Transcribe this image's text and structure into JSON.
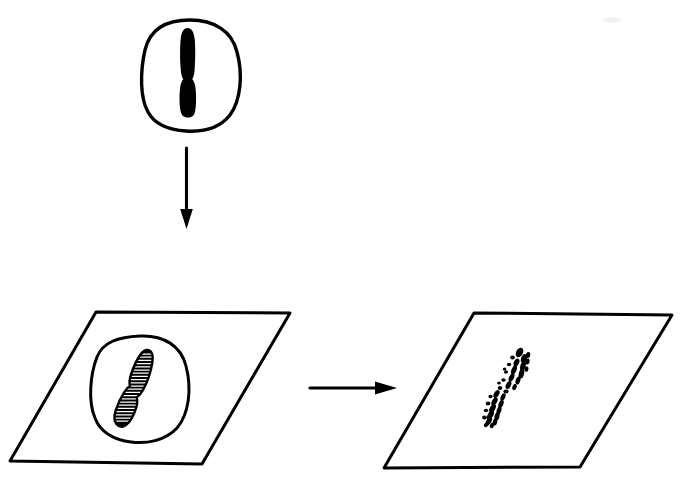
{
  "figure": {
    "title": "Chromosome preparation and in situ hybridization workflow",
    "background_color": "#ffffff",
    "ink_color": "#000000",
    "width": 690,
    "height": 486,
    "style": "black-and-white line drawing, no text labels"
  },
  "panels": [
    {
      "id": "panel-top-cell",
      "name": "intact-cell-with-chromosome",
      "description": "Rounded irregular cell outline containing a single solid black chromosome oriented vertically with a centromeric constriction below centre",
      "bounds": {
        "x": 141,
        "y": 20,
        "width": 99,
        "height": 112
      },
      "cell_outline": {
        "stroke_width": 3.2,
        "center": {
          "x": 190,
          "y": 76
        },
        "radius_x": 48,
        "radius_y": 55
      },
      "chromosome": {
        "type": "solid",
        "fill": "#000000",
        "top": {
          "x": 187,
          "y": 29
        },
        "bottom": {
          "x": 186,
          "y": 116
        },
        "max_width": 13,
        "centromere_y": 80
      }
    },
    {
      "id": "panel-bottom-left-slide",
      "name": "slide-with-banded-chromosome",
      "description": "Parallelogram representing a microscope slide; a circular cell outline sits on it containing one tilted chromosome drawn with fine horizontal banding (hatching)",
      "parallelogram": {
        "stroke_width": 3.0,
        "points": [
          {
            "x": 96,
            "y": 312
          },
          {
            "x": 290,
            "y": 313
          },
          {
            "x": 202,
            "y": 464
          },
          {
            "x": 10,
            "y": 461
          }
        ]
      },
      "cell_outline": {
        "stroke_width": 3.0,
        "center": {
          "x": 139,
          "y": 389
        },
        "radius_x": 47,
        "radius_y": 53
      },
      "chromosome": {
        "type": "banded",
        "fill": "#000000",
        "band_count": 22,
        "tilt_degrees": 22,
        "top": {
          "x": 148,
          "y": 351
        },
        "bottom": {
          "x": 113,
          "y": 424
        },
        "max_width": 15,
        "centromere_point": {
          "x": 128,
          "y": 388
        }
      }
    },
    {
      "id": "panel-bottom-right-slide",
      "name": "slide-with-hybridization-signal",
      "description": "Parallelogram representing a microscope slide bearing the same chromosome rendered as scattered dark dots and short dashes (labelled / fragmented signal pattern)",
      "parallelogram": {
        "stroke_width": 3.0,
        "points": [
          {
            "x": 474,
            "y": 313
          },
          {
            "x": 672,
            "y": 315
          },
          {
            "x": 580,
            "y": 467
          },
          {
            "x": 384,
            "y": 468
          }
        ]
      },
      "signal": {
        "type": "dotted",
        "fill": "#000000",
        "tilt_degrees": 22,
        "top": {
          "x": 521,
          "y": 351
        },
        "bottom": {
          "x": 489,
          "y": 425
        },
        "dot_count": 38
      }
    }
  ],
  "arrows": [
    {
      "id": "arrow-down",
      "name": "arrow-cell-to-slide",
      "direction": "down",
      "from": {
        "x": 186,
        "y": 148
      },
      "to": {
        "x": 186,
        "y": 228
      },
      "shaft_width": 3.0,
      "head_length": 18,
      "head_width": 13
    },
    {
      "id": "arrow-right",
      "name": "arrow-slide-to-hybridized-slide",
      "direction": "right",
      "from": {
        "x": 310,
        "y": 388
      },
      "to": {
        "x": 396,
        "y": 388
      },
      "shaft_width": 3.0,
      "head_length": 22,
      "head_width": 13
    }
  ],
  "artifacts": [
    {
      "id": "scan-speck",
      "name": "scan-speck",
      "position": {
        "x": 612,
        "y": 20
      },
      "size": 7,
      "opacity": 0.06
    }
  ]
}
